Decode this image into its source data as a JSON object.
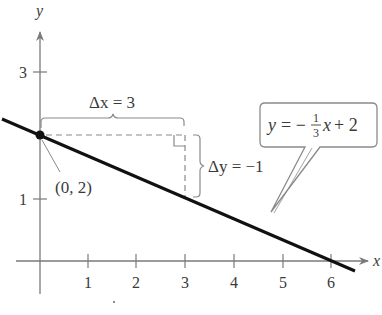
{
  "figure": {
    "axes": {
      "x_label": "x",
      "y_label": "y",
      "x_ticks": [
        "1",
        "2",
        "3",
        "4",
        "5",
        "6"
      ],
      "y_ticks": [
        "1",
        "3"
      ]
    },
    "point": {
      "label": "(0, 2)",
      "x": 0,
      "y": 2
    },
    "line": {
      "equation_lhs": "y = −",
      "fraction_num": "1",
      "fraction_den": "3",
      "equation_rhs": "x + 2",
      "slope": -0.3333,
      "intercept": 2
    },
    "run": {
      "label": "Δx = 3",
      "value": 3
    },
    "rise": {
      "label": "Δy = −1",
      "value": -1
    },
    "colors": {
      "line": "#111111",
      "axis": "#7a7a7a",
      "dashed": "#8a8a8a",
      "text": "#3a3a3a"
    }
  }
}
